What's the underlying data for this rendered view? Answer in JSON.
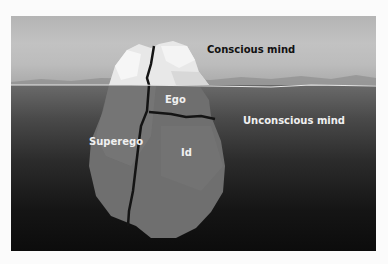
{
  "diagram": {
    "labels": {
      "conscious": "Conscious mind",
      "unconscious": "Unconscious mind",
      "ego": "Ego",
      "superego": "Superego",
      "id": "Id"
    },
    "colors": {
      "sky": "#bcbcbc",
      "water_top": "#6a6a6a",
      "water_bottom": "#0c0c0c",
      "iceberg_above": "#ececec",
      "iceberg_below": "#6e6e6e",
      "crack": "#111111",
      "waterline": "#e6e6e6"
    }
  }
}
